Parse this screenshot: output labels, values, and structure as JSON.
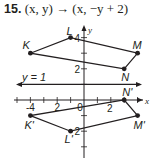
{
  "problem": {
    "number": "15.",
    "rule": "(x, y) → (x, −y + 2)"
  },
  "graph": {
    "axis_labels": {
      "x": "x",
      "y": "y"
    },
    "x_tick_labels": [
      {
        "value": -4,
        "text": "-4"
      },
      {
        "value": -2,
        "text": "2"
      },
      {
        "value": 0,
        "text": "0"
      },
      {
        "value": 2,
        "text": "2"
      }
    ],
    "y_tick_labels": [
      {
        "value": 4,
        "text": "4"
      },
      {
        "value": 2,
        "text": "2"
      },
      {
        "value": -2,
        "text": "2"
      }
    ],
    "x_range": [
      -6,
      5
    ],
    "y_range": [
      -4,
      5
    ],
    "line_of_reflection": {
      "label": "y = 1",
      "y": 1
    },
    "original": {
      "name": "KLMN",
      "vertices": [
        {
          "label": "K",
          "x": -4,
          "y": 3
        },
        {
          "label": "L",
          "x": -1,
          "y": 4
        },
        {
          "label": "M",
          "x": 4,
          "y": 3
        },
        {
          "label": "N",
          "x": 3,
          "y": 2
        }
      ]
    },
    "image": {
      "name": "K'L'M'N'",
      "vertices": [
        {
          "label": "K'",
          "x": -4,
          "y": -1
        },
        {
          "label": "L'",
          "x": -1,
          "y": -2
        },
        {
          "label": "M'",
          "x": 4,
          "y": -1
        },
        {
          "label": "N'",
          "x": 3,
          "y": 0
        }
      ]
    },
    "colors": {
      "ink": "#231f20"
    }
  }
}
